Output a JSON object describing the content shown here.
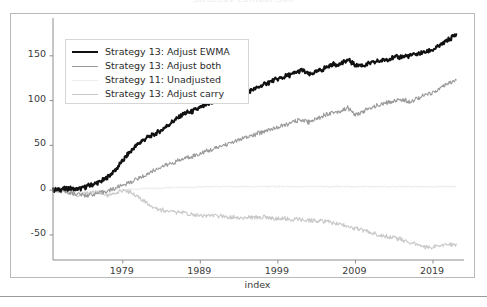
{
  "figure": {
    "title": "Strategy comparison",
    "width": 487,
    "height": 307,
    "background": "#ffffff",
    "frame_color": "#b9b9b9"
  },
  "axis_labels": {
    "x": "index",
    "y": ""
  },
  "ticks": {
    "y": [
      "150",
      "100",
      "50",
      "0",
      "-50"
    ],
    "x": [
      "1979",
      "1989",
      "1999",
      "2009",
      "2019"
    ]
  },
  "legend": {
    "position": "upper left",
    "entries": [
      {
        "label": "Strategy 13: Adjust EWMA",
        "color": "#111111",
        "width": 2.1
      },
      {
        "label": "Strategy 13: Adjust both",
        "color": "#9a9a9a",
        "width": 1.1
      },
      {
        "label": "Strategy 11: Unadjusted",
        "color": "#ededed",
        "width": 1.1
      },
      {
        "label": "Strategy 13: Adjust carry",
        "color": "#c9c9c9",
        "width": 1.1
      }
    ]
  },
  "chart_data": {
    "type": "line",
    "title": "Strategy comparison",
    "xlabel": "index",
    "ylabel": "",
    "xlim": [
      1970,
      2023
    ],
    "ylim": [
      -78,
      190
    ],
    "yticks": [
      150,
      100,
      50,
      0,
      -50
    ],
    "xticks": [
      1979,
      1989,
      1999,
      2009,
      2019
    ],
    "grid": false,
    "legend_position": "upper left",
    "x": [
      1970,
      1971,
      1972,
      1973,
      1974,
      1975,
      1976,
      1977,
      1978,
      1979,
      1980,
      1981,
      1982,
      1983,
      1984,
      1985,
      1986,
      1987,
      1988,
      1989,
      1990,
      1991,
      1992,
      1993,
      1994,
      1995,
      1996,
      1997,
      1998,
      1999,
      2000,
      2001,
      2002,
      2003,
      2004,
      2005,
      2006,
      2007,
      2008,
      2009,
      2010,
      2011,
      2012,
      2013,
      2014,
      2015,
      2016,
      2017,
      2018,
      2019,
      2020,
      2021,
      2022
    ],
    "series": [
      {
        "name": "Strategy 13: Adjust EWMA",
        "color": "#111111",
        "linewidth": 2.1,
        "values": [
          0,
          1,
          2,
          1,
          3,
          6,
          9,
          14,
          22,
          33,
          43,
          52,
          58,
          62,
          67,
          74,
          80,
          86,
          88,
          92,
          96,
          99,
          100,
          103,
          106,
          110,
          113,
          117,
          121,
          124,
          127,
          130,
          134,
          129,
          132,
          136,
          140,
          141,
          145,
          140,
          139,
          142,
          144,
          146,
          148,
          149,
          150,
          152,
          154,
          157,
          162,
          168,
          174
        ]
      },
      {
        "name": "Strategy 13: Adjust both",
        "color": "#9a9a9a",
        "linewidth": 1.1,
        "values": [
          0,
          -1,
          -2,
          -4,
          -6,
          -5,
          -3,
          -1,
          2,
          6,
          9,
          13,
          17,
          22,
          26,
          29,
          32,
          36,
          38,
          41,
          44,
          47,
          50,
          53,
          56,
          59,
          62,
          65,
          68,
          70,
          73,
          76,
          79,
          76,
          80,
          84,
          87,
          88,
          92,
          84,
          88,
          92,
          95,
          97,
          100,
          101,
          99,
          103,
          106,
          109,
          114,
          119,
          123
        ]
      },
      {
        "name": "Strategy 11: Unadjusted",
        "color": "#ededed",
        "linewidth": 1.1,
        "values": [
          0,
          -1,
          -1,
          -2,
          -2,
          -2,
          -1,
          -1,
          0,
          0,
          1,
          1,
          2,
          2,
          2,
          3,
          3,
          3,
          3,
          4,
          4,
          4,
          4,
          4,
          4,
          4,
          4,
          4,
          4,
          4,
          4,
          4,
          4,
          4,
          4,
          4,
          4,
          4,
          4,
          4,
          4,
          4,
          4,
          4,
          4,
          4,
          4,
          4,
          4,
          4,
          4,
          4,
          4
        ]
      },
      {
        "name": "Strategy 13: Adjust carry",
        "color": "#c9c9c9",
        "linewidth": 1.1,
        "values": [
          0,
          -1,
          -3,
          -6,
          -4,
          -2,
          -3,
          -6,
          -5,
          0,
          -2,
          -8,
          -14,
          -19,
          -22,
          -24,
          -25,
          -26,
          -27,
          -28,
          -28,
          -29,
          -29,
          -30,
          -31,
          -31,
          -30,
          -30,
          -31,
          -32,
          -32,
          -33,
          -33,
          -34,
          -34,
          -35,
          -36,
          -38,
          -40,
          -43,
          -45,
          -47,
          -50,
          -52,
          -53,
          -55,
          -58,
          -61,
          -63,
          -64,
          -62,
          -61,
          -60
        ]
      }
    ]
  }
}
